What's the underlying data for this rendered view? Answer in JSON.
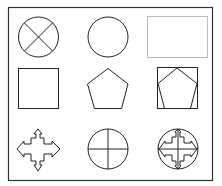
{
  "frame": {
    "stroke": "#333333",
    "background": "#ffffff"
  },
  "shapes": [
    {
      "id": "circle-with-x",
      "label": "circle with diagonal cross",
      "row": 1,
      "col": 1
    },
    {
      "id": "circle",
      "label": "circle",
      "row": 1,
      "col": 2
    },
    {
      "id": "dotted-rectangle",
      "label": "dotted rectangle",
      "row": 1,
      "col": 3
    },
    {
      "id": "square",
      "label": "square",
      "row": 2,
      "col": 1
    },
    {
      "id": "pentagon",
      "label": "pentagon",
      "row": 2,
      "col": 2
    },
    {
      "id": "pentagon-in-square",
      "label": "pentagon inscribed in square",
      "row": 2,
      "col": 3
    },
    {
      "id": "four-way-arrow-cross",
      "label": "four-way arrow cross",
      "row": 3,
      "col": 1
    },
    {
      "id": "circle-with-plus",
      "label": "circle with plus cross",
      "row": 3,
      "col": 2
    },
    {
      "id": "compound-arrow-cross-circle",
      "label": "arrow cross combined with circle and plus",
      "row": 3,
      "col": 3
    }
  ],
  "colors": {
    "stroke": "#222222",
    "dotted": "#777777"
  }
}
